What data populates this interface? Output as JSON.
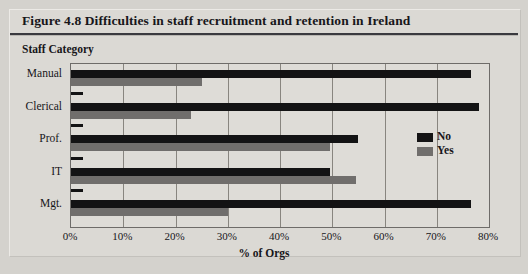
{
  "figure": {
    "title": "Figure 4.8 Difficulties in staff recruitment and retention in Ireland",
    "y_axis_group_label": "Staff Category"
  },
  "legend": {
    "position": "right-center",
    "entries": [
      {
        "label": "No",
        "color": "#131314",
        "key": "no"
      },
      {
        "label": "Yes",
        "color": "#706e6c",
        "key": "yes"
      }
    ]
  },
  "axis": {
    "x_tick_labels": [
      "0%",
      "10%",
      "20%",
      "30%",
      "40%",
      "50%",
      "60%",
      "70%",
      "80%"
    ],
    "x_title": "% of Orgs"
  },
  "chart_data": {
    "type": "bar",
    "orientation": "horizontal",
    "title": "Figure 4.8 Difficulties in staff recruitment and retention in Ireland",
    "xlabel": "% of Orgs",
    "ylabel": "Staff Category",
    "xlim": [
      0,
      80
    ],
    "xticks": [
      0,
      10,
      20,
      30,
      40,
      50,
      60,
      70,
      80
    ],
    "xtick_labels": [
      "0%",
      "10%",
      "20%",
      "30%",
      "40%",
      "50%",
      "60%",
      "70%",
      "80%"
    ],
    "grid": "vertical",
    "legend_position": "right-center",
    "categories": [
      "Manual",
      "Clerical",
      "Prof.",
      "IT",
      "Mgt."
    ],
    "series": [
      {
        "name": "No",
        "color": "#131314",
        "values": [
          76.5,
          78.0,
          55.0,
          49.5,
          76.5
        ]
      },
      {
        "name": "Yes",
        "color": "#706e6c",
        "values": [
          25.0,
          23.0,
          49.5,
          54.5,
          30.0
        ]
      }
    ]
  }
}
